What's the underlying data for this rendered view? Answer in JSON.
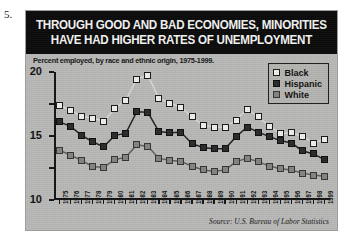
{
  "item_number": "5.",
  "source_note": "Source: U.S. Bureau of Labor Statistics",
  "legend": {
    "entries": [
      {
        "label": "Black",
        "swatch": "open-white-square",
        "color": "#efefec"
      },
      {
        "label": "Hispanic",
        "swatch": "filled-black-square",
        "color": "#2a2a2a"
      },
      {
        "label": "White",
        "swatch": "filled-gray-square",
        "color": "#84847f"
      }
    ]
  },
  "chart_data": {
    "type": "line",
    "title": "THROUGH GOOD AND BAD ECONOMIES, MINORITIES HAVE HAD HIGHER RATES OF UNEMPLOYMENT",
    "title_lines": [
      "THROUGH GOOD AND BAD ECONOMIES, MINORITIES",
      "HAVE HAD HIGHER RATES OF UNEMPLOYMENT"
    ],
    "subtitle": "Percent employed, by race and ethnic origin, 1975-1999.",
    "xlabel": "",
    "ylabel": "",
    "ylim": [
      0,
      20
    ],
    "yticks": [
      0,
      5,
      10,
      15,
      20
    ],
    "ytick_labels": [
      "0",
      "5",
      "10",
      "15",
      "20"
    ],
    "grid": false,
    "legend_position": "top-right",
    "x": [
      1975,
      1976,
      1977,
      1978,
      1979,
      1980,
      1981,
      1982,
      1983,
      1984,
      1985,
      1986,
      1987,
      1988,
      1989,
      1990,
      1991,
      1992,
      1993,
      1994,
      1995,
      1996,
      1997,
      1998,
      1999
    ],
    "categories": [
      "1975",
      "1976",
      "1977",
      "1978",
      "1979",
      "1980",
      "1981",
      "1982",
      "1983",
      "1984",
      "1985",
      "1986",
      "1987",
      "1988",
      "1989",
      "1990",
      "1991",
      "1992",
      "1993",
      "1994",
      "1995",
      "1996",
      "1997",
      "1998",
      "1999"
    ],
    "series": [
      {
        "name": "Black",
        "color": "#efefec",
        "values": [
          14.8,
          14.0,
          13.1,
          12.8,
          12.3,
          14.3,
          15.6,
          18.9,
          19.5,
          15.9,
          15.1,
          14.5,
          13.0,
          11.7,
          11.4,
          11.4,
          12.5,
          14.2,
          13.0,
          11.5,
          10.4,
          10.5,
          10.0,
          8.9,
          9.5
        ]
      },
      {
        "name": "Hispanic",
        "color": "#2a2a2a",
        "values": [
          12.2,
          11.5,
          10.1,
          9.1,
          8.3,
          10.1,
          10.4,
          13.8,
          13.7,
          10.7,
          10.5,
          10.6,
          8.8,
          8.2,
          8.0,
          8.0,
          9.9,
          11.4,
          10.6,
          9.9,
          9.3,
          8.9,
          7.7,
          7.2,
          6.3
        ]
      },
      {
        "name": "White",
        "color": "#84847f",
        "values": [
          7.8,
          7.0,
          6.2,
          5.2,
          5.1,
          6.3,
          6.7,
          8.6,
          8.4,
          6.5,
          6.2,
          6.0,
          5.3,
          4.7,
          4.5,
          4.7,
          6.0,
          6.5,
          6.0,
          5.3,
          4.9,
          4.7,
          4.2,
          3.9,
          3.7
        ]
      }
    ]
  }
}
